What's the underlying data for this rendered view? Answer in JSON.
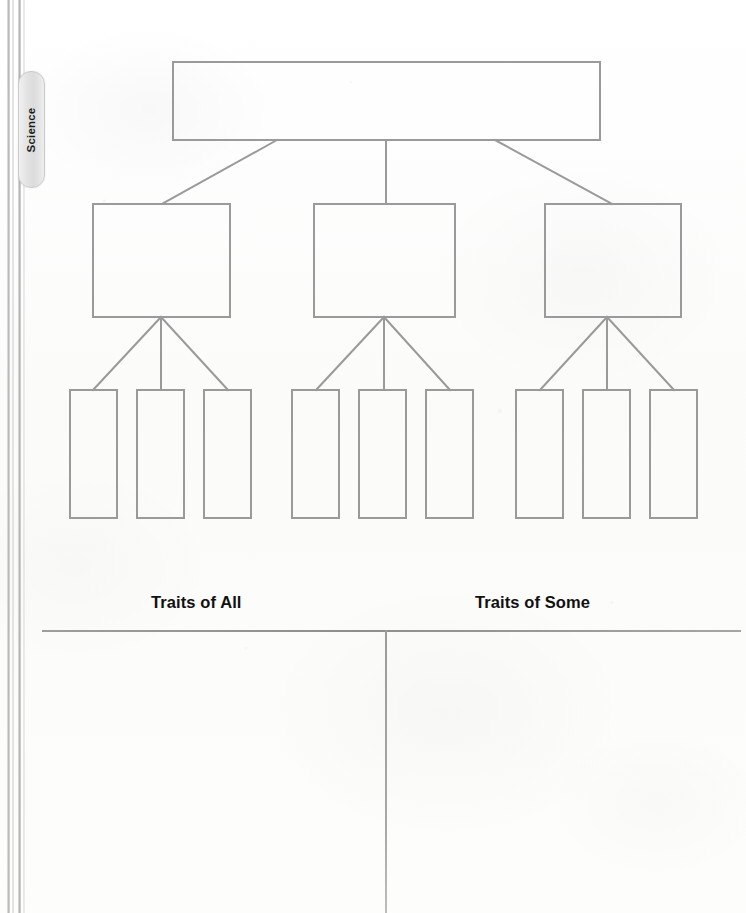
{
  "page": {
    "width": 746,
    "height": 913,
    "background_color": "#fdfdfd",
    "stroke_color": "#9a9a9a",
    "rule_color": "#8e8e8e"
  },
  "subject_tab": {
    "label": "Science",
    "orientation": "vertical",
    "text_color": "#1b1b1b",
    "fill_color": "#e6e6e6",
    "border_color": "#cbcbcb"
  },
  "binding": {
    "name": "book-spine",
    "line_count": 4
  },
  "organizer": {
    "type": "hierarchy-tree",
    "levels": 3,
    "stroke_color": "#9a9a9a",
    "stroke_width": 2,
    "top_box": {
      "label": "",
      "x": 173,
      "y": 62,
      "width": 427,
      "height": 78
    },
    "middle_boxes": [
      {
        "label": "",
        "x": 93,
        "y": 204,
        "width": 137,
        "height": 113
      },
      {
        "label": "",
        "x": 314,
        "y": 204,
        "width": 141,
        "height": 113
      },
      {
        "label": "",
        "x": 545,
        "y": 204,
        "width": 136,
        "height": 113
      }
    ],
    "bottom_boxes": [
      {
        "label": "",
        "x": 70,
        "y": 390,
        "width": 47,
        "height": 128
      },
      {
        "label": "",
        "x": 137,
        "y": 390,
        "width": 47,
        "height": 128
      },
      {
        "label": "",
        "x": 204,
        "y": 390,
        "width": 47,
        "height": 128
      },
      {
        "label": "",
        "x": 292,
        "y": 390,
        "width": 47,
        "height": 128
      },
      {
        "label": "",
        "x": 359,
        "y": 390,
        "width": 47,
        "height": 128
      },
      {
        "label": "",
        "x": 426,
        "y": 390,
        "width": 47,
        "height": 128
      },
      {
        "label": "",
        "x": 516,
        "y": 390,
        "width": 47,
        "height": 128
      },
      {
        "label": "",
        "x": 583,
        "y": 390,
        "width": 47,
        "height": 128
      },
      {
        "label": "",
        "x": 650,
        "y": 390,
        "width": 47,
        "height": 128
      }
    ],
    "connectors": [
      {
        "from": "top-box",
        "to": "middle-box-1",
        "style": "diagonal"
      },
      {
        "from": "top-box",
        "to": "middle-box-2",
        "style": "vertical"
      },
      {
        "from": "top-box",
        "to": "middle-box-3",
        "style": "diagonal"
      },
      {
        "from": "middle-box-1",
        "to": "bottom-box-1",
        "style": "diagonal"
      },
      {
        "from": "middle-box-1",
        "to": "bottom-box-2",
        "style": "vertical"
      },
      {
        "from": "middle-box-1",
        "to": "bottom-box-3",
        "style": "diagonal"
      },
      {
        "from": "middle-box-2",
        "to": "bottom-box-4",
        "style": "diagonal"
      },
      {
        "from": "middle-box-2",
        "to": "bottom-box-5",
        "style": "vertical"
      },
      {
        "from": "middle-box-2",
        "to": "bottom-box-6",
        "style": "diagonal"
      },
      {
        "from": "middle-box-3",
        "to": "bottom-box-7",
        "style": "diagonal"
      },
      {
        "from": "middle-box-3",
        "to": "bottom-box-8",
        "style": "vertical"
      },
      {
        "from": "middle-box-3",
        "to": "bottom-box-9",
        "style": "diagonal"
      }
    ]
  },
  "traits_table": {
    "columns": [
      {
        "heading": "Traits of All",
        "content": ""
      },
      {
        "heading": "Traits of Some",
        "content": ""
      }
    ],
    "heading_color": "#111111",
    "rule_color": "#8e8e8e",
    "divider_color": "#9b9b9b"
  }
}
